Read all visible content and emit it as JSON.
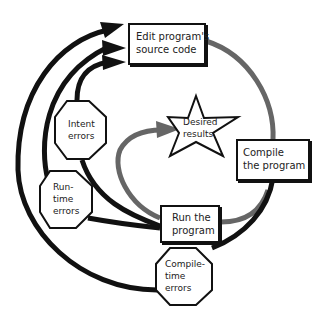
{
  "diagram": {
    "title": "",
    "colors": {
      "error_path": "#111111",
      "success_path": "#666666",
      "node_border": "#111111",
      "node_fill": "#ffffff"
    },
    "nodes": {
      "edit": {
        "label": "Edit program's\nsource code",
        "shape": "rectangle"
      },
      "compile": {
        "label": "Compile\nthe program",
        "shape": "rectangle"
      },
      "run": {
        "label": "Run the\nprogram",
        "shape": "rectangle"
      },
      "desired": {
        "label": "Desired\nresults",
        "shape": "star"
      },
      "intent_errors": {
        "label": "Intent\nerrors",
        "shape": "octagon"
      },
      "runtime_errors": {
        "label": "Run-\ntime\nerrors",
        "shape": "octagon"
      },
      "compile_errors": {
        "label": "Compile-\ntime\nerrors",
        "shape": "octagon"
      }
    },
    "edges": [
      {
        "from": "edit",
        "to": "compile",
        "color": "gray"
      },
      {
        "from": "compile",
        "to": "run",
        "color": "gray"
      },
      {
        "from": "run",
        "to": "desired",
        "color": "gray",
        "arrow": true
      },
      {
        "from": "compile",
        "to": "compile_errors",
        "color": "black"
      },
      {
        "from": "compile_errors",
        "to": "edit",
        "color": "black",
        "arrow": true
      },
      {
        "from": "run",
        "to": "runtime_errors",
        "color": "black"
      },
      {
        "from": "runtime_errors",
        "to": "edit",
        "color": "black",
        "arrow": true
      },
      {
        "from": "run",
        "to": "intent_errors",
        "color": "black"
      },
      {
        "from": "intent_errors",
        "to": "edit",
        "color": "black",
        "arrow": true
      }
    ]
  }
}
